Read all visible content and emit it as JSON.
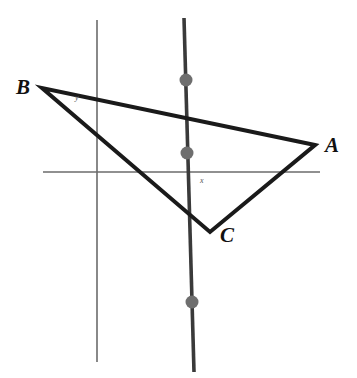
{
  "figure": {
    "background_color": "#ffffff"
  },
  "labels": {
    "vertex_a": "A",
    "vertex_b": "B",
    "vertex_c": "C",
    "axis_x": "x",
    "axis_y": "y"
  },
  "colors": {
    "triangle_stroke": "#1a1a1a",
    "axis_stroke": "#6b6b6b",
    "marked_line_stroke": "#3a3a3a",
    "point_fill": "#6e6e6e",
    "label_text": "#111111",
    "axis_label_text": "#555555"
  },
  "chart_data": {
    "type": "scatter",
    "xlabel": "x",
    "ylabel": "y",
    "grid": false,
    "legend": null,
    "axes": {
      "x_axis": {
        "x1": 43,
        "y1": 172,
        "x2": 320,
        "y2": 172,
        "width": 1.6
      },
      "y_axis": {
        "x1": 97,
        "y1": 20,
        "x2": 97,
        "y2": 362,
        "width": 1.6
      }
    },
    "origin_pixel": {
      "x": 97,
      "y": 172
    },
    "triangle": {
      "name": "ABC",
      "closed": true,
      "stroke_width": 4,
      "vertices": [
        {
          "label": "A",
          "x": 315,
          "y": 145
        },
        {
          "label": "B",
          "x": 42,
          "y": 88
        },
        {
          "label": "C",
          "x": 210,
          "y": 232
        }
      ]
    },
    "marked_line": {
      "description": "thick near-vertical line through the figure",
      "x1": 184,
      "y1": 18,
      "x2": 194,
      "y2": 372,
      "stroke_width": 3.6
    },
    "marked_points": [
      {
        "x": 186,
        "y": 80,
        "r": 6.5
      },
      {
        "x": 187,
        "y": 153,
        "r": 6.5
      },
      {
        "x": 192,
        "y": 302,
        "r": 6.5
      }
    ]
  }
}
